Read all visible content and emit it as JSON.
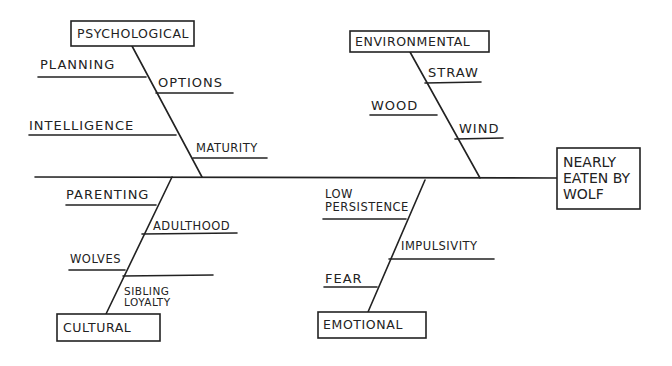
{
  "diagram": {
    "type": "fishbone",
    "effect": {
      "line1": "Nearly",
      "line2": "Eaten by",
      "line3": "Wolf"
    },
    "categories": {
      "psychological": {
        "label": "Psychological",
        "causes": [
          "Planning",
          "Options",
          "Intelligence",
          "Maturity"
        ]
      },
      "environmental": {
        "label": "Environmental",
        "causes": [
          "Straw",
          "Wood",
          "Wind"
        ]
      },
      "cultural": {
        "label": "Cultural",
        "causes": [
          "Parenting",
          "Adulthood",
          "Wolves",
          "",
          "Sibling",
          "Loyalty"
        ]
      },
      "emotional": {
        "label": "Emotional",
        "causes": [
          "Low",
          "Persistence",
          "Impulsivity",
          "Fear"
        ]
      }
    },
    "colors": {
      "ink": "#222222",
      "background": "#ffffff"
    }
  }
}
